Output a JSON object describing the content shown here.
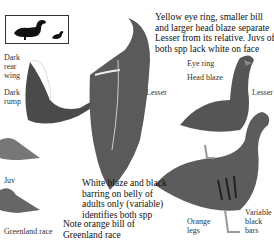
{
  "size_comparison": {
    "icon_large": "goose-silhouette-icon",
    "icon_small": "small-bird-silhouette-icon"
  },
  "labels": {
    "dark_rear_wing": "Dark rear wing",
    "dark_rump": "Dark rump",
    "juv": "Juv",
    "greenland_race": "Greenland race",
    "lesser_left": "Lesser",
    "lesser_right": "Lesser",
    "eye_ring": "Eye ring",
    "head_blaze": "Head blaze",
    "orange_legs": "Orange legs",
    "variable_black_bars": "Variable black bars"
  },
  "notes": {
    "top_right": "Yellow eye ring, smaller bill and larger head blaze separate Lesser from its relative. Juvs of both spp lack white on face",
    "middle": "White blaze and black barring on belly of adults only (variable) identifies both spp",
    "bottom": "Note orange bill of Greenland race"
  },
  "colors": {
    "ink": "#1a1a1a",
    "bird_dark": "#3a3a3a",
    "bird_mid": "#6e6e6e",
    "bird_light": "#b5b5b5"
  }
}
